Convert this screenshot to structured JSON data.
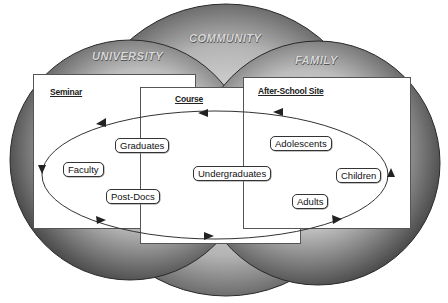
{
  "circles": [
    {
      "label": "UNIVERSITY"
    },
    {
      "label": "COMMUNITY"
    },
    {
      "label": "FAMILY"
    }
  ],
  "boxes": [
    {
      "title": "Seminar"
    },
    {
      "title": "Course"
    },
    {
      "title": "After-School Site"
    }
  ],
  "participants": [
    {
      "label": "Graduates"
    },
    {
      "label": "Faculty"
    },
    {
      "label": "Post-Docs"
    },
    {
      "label": "Undergraduates"
    },
    {
      "label": "Adolescents"
    },
    {
      "label": "Children"
    },
    {
      "label": "Adults"
    }
  ],
  "colors": {
    "sphere_light": "#f2f2f2",
    "sphere_dark": "#3a3a3a",
    "line": "#333333"
  }
}
